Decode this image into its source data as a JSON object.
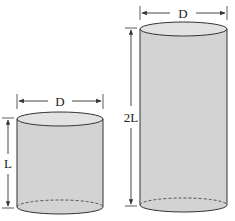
{
  "diagram": {
    "colors": {
      "fill": "#d3d3d3",
      "top": "#e2e2e2",
      "stroke": "#333333",
      "background": "#ffffff"
    },
    "cylinders": [
      {
        "id": "short",
        "diameter_label": "D",
        "height_label": "L"
      },
      {
        "id": "tall",
        "diameter_label": "D",
        "height_label": "2L"
      }
    ]
  }
}
